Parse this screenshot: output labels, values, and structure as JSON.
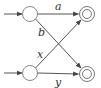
{
  "diagram": {
    "type": "automaton",
    "states": [
      {
        "id": "s1",
        "kind": "initial",
        "accepting": false
      },
      {
        "id": "s2",
        "kind": "initial",
        "accepting": false
      },
      {
        "id": "f1",
        "kind": "final",
        "accepting": true
      },
      {
        "id": "f2",
        "kind": "final",
        "accepting": true
      }
    ],
    "edges": [
      {
        "from": "s1",
        "to": "f1",
        "label": "a"
      },
      {
        "from": "s1",
        "to": "f2",
        "label": "b"
      },
      {
        "from": "s2",
        "to": "f1",
        "label": "x"
      },
      {
        "from": "s2",
        "to": "f2",
        "label": "y"
      }
    ],
    "colors": {
      "stroke": "#555555",
      "text": "#333333"
    }
  }
}
